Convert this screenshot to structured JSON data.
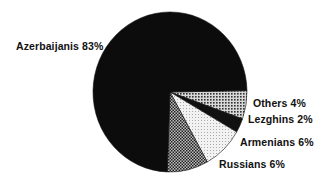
{
  "chart_data": {
    "type": "pie",
    "title": "",
    "categories": [
      "Azerbaijanis",
      "Russians",
      "Armenians",
      "Lezghins",
      "Others"
    ],
    "values": [
      83,
      6,
      6,
      2,
      4
    ],
    "unit": "%",
    "legend": "none (direct labels)",
    "slices": [
      {
        "name": "Others",
        "value": 4,
        "label": "Others 4%",
        "fill": "dots-dark",
        "color": "#8a8a8a"
      },
      {
        "name": "Lezghins",
        "value": 2,
        "label": "Lezghins 2%",
        "fill": "solid",
        "color": "#111111"
      },
      {
        "name": "Armenians",
        "value": 6,
        "label": "Armenians 6%",
        "fill": "dots-light",
        "color": "#e6e6e6"
      },
      {
        "name": "Russians",
        "value": 6,
        "label": "Russians 6%",
        "fill": "crosshatch",
        "color": "#777777"
      },
      {
        "name": "Azerbaijanis",
        "value": 83,
        "label": "Azerbaijanis 83%",
        "fill": "solid",
        "color": "#0c0c0c"
      }
    ]
  },
  "labels": {
    "azerbaijanis": "Azerbaijanis 83%",
    "others": "Others 4%",
    "lezghins": "Lezghins 2%",
    "armenians": "Armenians 6%",
    "russians": "Russians 6%"
  }
}
